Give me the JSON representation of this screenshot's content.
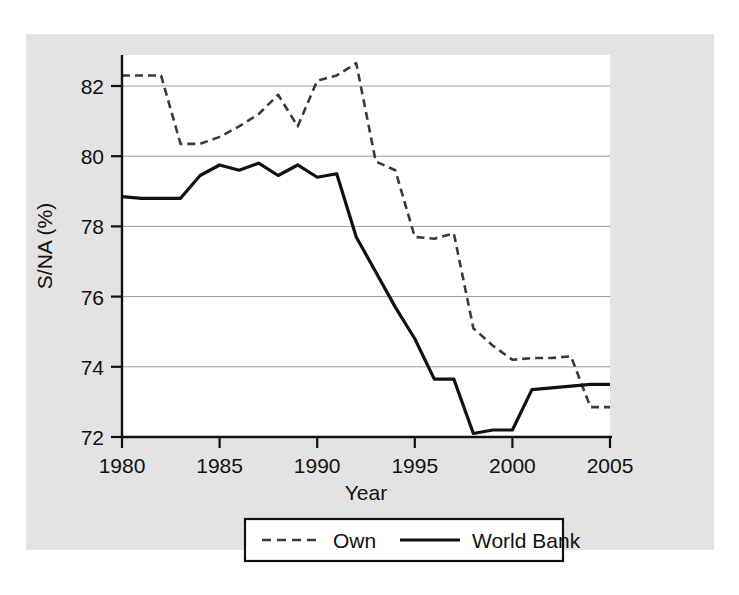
{
  "chart_data": {
    "type": "line",
    "title": "",
    "xlabel": "Year",
    "ylabel": "S/NA (%)",
    "xlim": [
      1980,
      2005
    ],
    "ylim": [
      72,
      82.9
    ],
    "grid": true,
    "legend_position": "bottom",
    "x_ticks": [
      "1980",
      "1985",
      "1990",
      "1995",
      "2000",
      "2005"
    ],
    "x_tick_values": [
      1980,
      1985,
      1990,
      1995,
      2000,
      2005
    ],
    "y_ticks": [
      "72",
      "74",
      "76",
      "78",
      "80",
      "82"
    ],
    "y_tick_values": [
      72,
      74,
      76,
      78,
      80,
      82
    ],
    "x": [
      1980,
      1981,
      1982,
      1983,
      1984,
      1985,
      1986,
      1987,
      1988,
      1989,
      1990,
      1991,
      1992,
      1993,
      1994,
      1995,
      1996,
      1997,
      1998,
      1999,
      2000,
      2001,
      2002,
      2003,
      2004,
      2005
    ],
    "series": [
      {
        "name": "Own",
        "style": "dashed",
        "color": "#3a3a3a",
        "values": [
          82.3,
          82.3,
          82.3,
          80.35,
          80.35,
          80.55,
          80.85,
          81.2,
          81.75,
          80.85,
          82.15,
          82.3,
          82.65,
          79.85,
          79.6,
          77.7,
          77.65,
          77.8,
          75.1,
          74.6,
          74.2,
          74.25,
          74.25,
          74.3,
          72.85,
          72.85
        ]
      },
      {
        "name": "World Bank",
        "style": "solid",
        "color": "#111111",
        "values": [
          78.85,
          78.8,
          78.8,
          78.8,
          79.45,
          79.75,
          79.6,
          79.8,
          79.45,
          79.75,
          79.4,
          79.5,
          77.7,
          76.7,
          75.7,
          74.8,
          73.65,
          73.65,
          72.1,
          72.2,
          72.2,
          73.35,
          73.4,
          73.45,
          73.5,
          73.5
        ]
      }
    ]
  },
  "legend": {
    "entries": [
      {
        "label": "Own",
        "style": "dashed"
      },
      {
        "label": "World Bank",
        "style": "solid"
      }
    ]
  }
}
